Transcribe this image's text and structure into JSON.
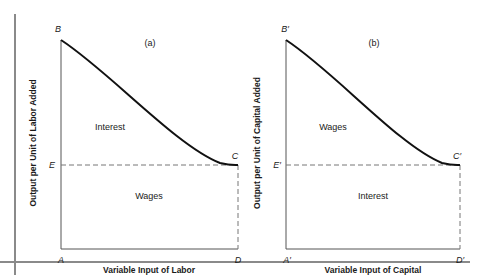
{
  "frame": {
    "rule_color": "#8a8a8a"
  },
  "panel_a": {
    "title": "(a)",
    "points": {
      "B": "B",
      "C": "C",
      "D": "D",
      "E": "E",
      "A": "A"
    },
    "upper_region_label": "Interest",
    "lower_region_label": "Wages",
    "x_axis_label": "Variable Input of Labor",
    "y_axis_label": "Output per Unit of Labor Added"
  },
  "panel_b": {
    "title": "(b)",
    "points": {
      "B": "B′",
      "C": "C′",
      "D": "D′",
      "E": "E′",
      "A": "A′"
    },
    "upper_region_label": "Wages",
    "lower_region_label": "Interest",
    "x_axis_label": "Variable Input of Capital",
    "y_axis_label": "Output per Unit of Capital Added"
  },
  "colors": {
    "curve": "#111111",
    "axis": "#555555",
    "dashed": "#777777"
  }
}
